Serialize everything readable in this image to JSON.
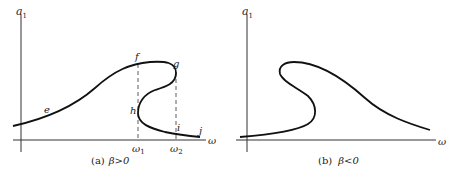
{
  "panels": [
    {
      "id": "a",
      "y_axis_label": "a",
      "y_axis_sub": "1",
      "x_axis_label": "ω",
      "points": {
        "e": "e",
        "f": "f",
        "g": "g",
        "h": "h",
        "i": "i",
        "j": "j"
      },
      "ticks": [
        {
          "label": "ω",
          "sub": "1"
        },
        {
          "label": "ω",
          "sub": "2"
        }
      ],
      "caption": {
        "prefix": "(a)",
        "text": "β>0"
      }
    },
    {
      "id": "b",
      "y_axis_label": "a",
      "y_axis_sub": "1",
      "x_axis_label": "ω",
      "caption": {
        "prefix": "(b)",
        "text": "β<0"
      }
    }
  ],
  "colors": {
    "curve": "#111111",
    "axis": "#333333",
    "text": "#222222"
  }
}
